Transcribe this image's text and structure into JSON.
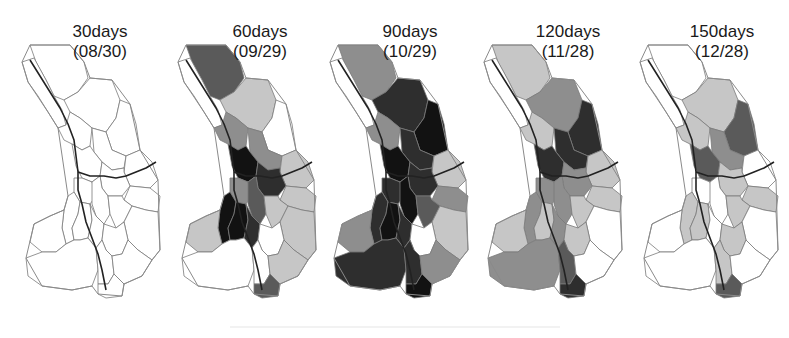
{
  "figure": {
    "type": "choropleth map series",
    "legend_levels": {
      "none": "#ffffff",
      "low": "#c4c4c4",
      "mid": "#8c8c8c",
      "high": "#555555",
      "very_high": "#2b2b2b",
      "max": "#141414"
    },
    "panels": [
      {
        "days": "30days",
        "date": "(08/30)"
      },
      {
        "days": "60days",
        "date": "(09/29)"
      },
      {
        "days": "90days",
        "date": "(10/29)"
      },
      {
        "days": "120days",
        "date": "(11/28)"
      },
      {
        "days": "150days",
        "date": "(12/28)"
      }
    ]
  }
}
